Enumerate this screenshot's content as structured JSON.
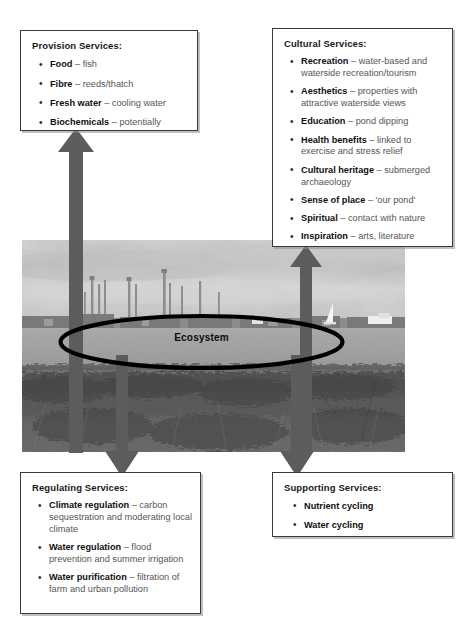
{
  "diagram": {
    "center_label": "Ecosystem",
    "arrow_color": "#5c5c5c",
    "box_border_color": "#3a3a3a",
    "term_color": "#101010",
    "desc_color": "#555555"
  },
  "boxes": {
    "provision": {
      "title": "Provision Services:",
      "items": [
        {
          "term": "Food",
          "desc": " – fish"
        },
        {
          "term": "Fibre",
          "desc": " – reeds/thatch"
        },
        {
          "term": "Fresh water",
          "desc": " – cooling water"
        },
        {
          "term": "Biochemicals",
          "desc": " – potentially"
        }
      ]
    },
    "cultural": {
      "title": "Cultural Services:",
      "items": [
        {
          "term": "Recreation",
          "desc": " – water-based and waterside recreation/tourism"
        },
        {
          "term": "Aesthetics",
          "desc": " – properties with attractive waterside views"
        },
        {
          "term": "Education",
          "desc": " – pond dipping"
        },
        {
          "term": "Health benefits",
          "desc": " – linked to exercise and stress relief"
        },
        {
          "term": "Cultural heritage",
          "desc": " – submerged archaeology"
        },
        {
          "term": "Sense of place",
          "desc": " – 'our pond'"
        },
        {
          "term": "Spiritual",
          "desc": " – contact with nature"
        },
        {
          "term": "Inspiration",
          "desc": " – arts, literature"
        }
      ]
    },
    "regulating": {
      "title": "Regulating Services:",
      "items": [
        {
          "term": "Climate regulation",
          "desc": " – carbon sequestration and moderating local climate"
        },
        {
          "term": "Water regulation",
          "desc": " – flood prevention and summer irrigation"
        },
        {
          "term": "Water purification",
          "desc": " – filtration of farm and urban pollution"
        }
      ]
    },
    "supporting": {
      "title": "Supporting Services:",
      "items": [
        {
          "term": "Nutrient cycling",
          "desc": ""
        },
        {
          "term": "Water cycling",
          "desc": ""
        }
      ]
    }
  },
  "photo": {
    "description": "Grayscale estuary landscape with industrial chimneys on the horizon, open water and a small white sailboat, and dense scrub vegetation in the foreground"
  }
}
